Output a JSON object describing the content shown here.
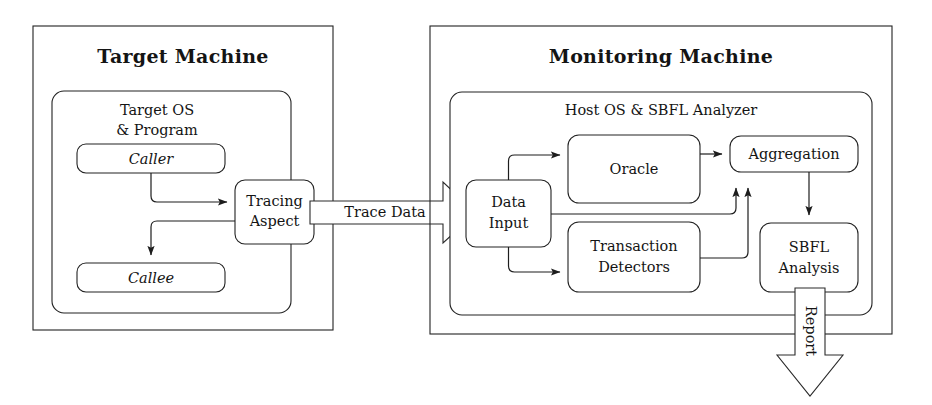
{
  "diagram": {
    "background_color": "#ffffff",
    "line_color": "#222222",
    "text_color": "#141414"
  },
  "target_machine": {
    "title": "Target Machine",
    "inner_container": {
      "title_line1": "Target OS",
      "title_line2": "& Program"
    },
    "nodes": {
      "caller": "Caller",
      "callee": "Callee",
      "tracing_aspect_line1": "Tracing",
      "tracing_aspect_line2": "Aspect"
    }
  },
  "monitoring_machine": {
    "title": "Monitoring Machine",
    "inner_container": {
      "title": "Host OS & SBFL Analyzer"
    },
    "nodes": {
      "data_input_line1": "Data",
      "data_input_line2": "Input",
      "oracle": "Oracle",
      "transaction_detectors_line1": "Transaction",
      "transaction_detectors_line2": "Detectors",
      "aggregation": "Aggregation",
      "sbfl_analysis_line1": "SBFL",
      "sbfl_analysis_line2": "Analysis"
    }
  },
  "flows": {
    "trace_data": "Trace Data",
    "report": "Report"
  }
}
